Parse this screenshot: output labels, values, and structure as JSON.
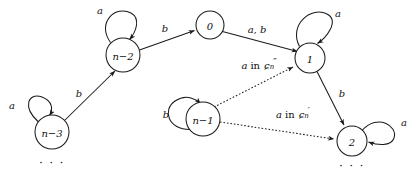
{
  "diagram": {
    "type": "finite-state-automaton-transition-diagram",
    "nodes": [
      {
        "id": "n-2",
        "label": "n−2",
        "cx": 123,
        "cy": 55,
        "r": 17
      },
      {
        "id": "0",
        "label": "0",
        "cx": 210,
        "cy": 25,
        "r": 14
      },
      {
        "id": "1",
        "label": "1",
        "cx": 310,
        "cy": 58,
        "r": 15
      },
      {
        "id": "n-3",
        "label": "n−3",
        "cx": 52,
        "cy": 132,
        "r": 17
      },
      {
        "id": "n-1",
        "label": "n−1",
        "cx": 203,
        "cy": 119,
        "r": 17
      },
      {
        "id": "2",
        "label": "2",
        "cx": 352,
        "cy": 141,
        "r": 15
      }
    ],
    "self_loops": [
      {
        "node": "n-2",
        "label": "a",
        "label_x": 100,
        "label_y": 10,
        "position": "top-left"
      },
      {
        "node": "1",
        "label": "a",
        "label_x": 338,
        "label_y": 13,
        "position": "top-right"
      },
      {
        "node": "n-3",
        "label": "a",
        "label_x": 12,
        "label_y": 105,
        "position": "top-left"
      },
      {
        "node": "n-1",
        "label": "b",
        "label_x": 166,
        "label_y": 114,
        "position": "left"
      },
      {
        "node": "2",
        "label": "a",
        "label_x": 404,
        "label_y": 122,
        "position": "top-right"
      }
    ],
    "edges": [
      {
        "from": "n-2",
        "to": "0",
        "label": "b",
        "label_x": 165,
        "label_y": 28,
        "style": "solid"
      },
      {
        "from": "0",
        "to": "1",
        "label": "a, b",
        "label_x": 257,
        "label_y": 29,
        "style": "solid"
      },
      {
        "from": "n-3",
        "to": "n-2",
        "label": "b",
        "label_x": 79,
        "label_y": 93,
        "style": "solid"
      },
      {
        "from": "1",
        "to": "2",
        "label": "b",
        "label_x": 342,
        "label_y": 93,
        "style": "solid"
      }
    ],
    "dashed_edges": [
      {
        "from": "n-1",
        "to": "1",
        "label_plain": "a in C''n",
        "label_x": 259,
        "label_y": 65,
        "label_parts": {
          "letter": "a",
          "word": "in",
          "script": "ɕ",
          "sub": "n",
          "prime": "″"
        }
      },
      {
        "from": "n-1",
        "to": "2",
        "label_plain": "a in C'n",
        "label_x": 293,
        "label_y": 114,
        "label_parts": {
          "letter": "a",
          "word": "in",
          "script": "ɕ",
          "sub": "n",
          "prime": "′"
        }
      }
    ],
    "ellipses": [
      {
        "id": "ellipsis-left",
        "text": "· · ·",
        "x": 52,
        "y": 163
      },
      {
        "id": "ellipsis-right",
        "text": "· · ·",
        "x": 352,
        "y": 166
      }
    ],
    "colors": {
      "stroke": "#1a1a1a",
      "node_fill": "#ffffff",
      "text": "#111111",
      "background": "#ffffff"
    }
  }
}
